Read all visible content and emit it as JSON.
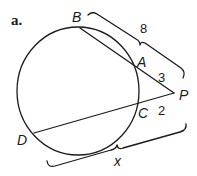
{
  "figure": {
    "part_label": "a.",
    "points": {
      "B": "B",
      "A": "A",
      "P": "P",
      "C": "C",
      "D": "D"
    },
    "measures": {
      "PB": "8",
      "PA": "3",
      "PC": "2",
      "PD": "x"
    }
  }
}
